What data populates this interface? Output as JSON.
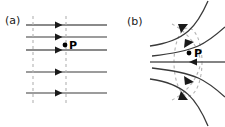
{
  "figure": {
    "width": 225,
    "height": 127,
    "background": "#ffffff",
    "line_color": "#3a3a3a",
    "bold_line_color": "#808080",
    "dash_color": "#b0b0b0",
    "point_color": "#000000",
    "text_color": "#1a1a1a"
  },
  "panels": [
    {
      "id": "a",
      "label": "(a)",
      "description": "uniform-parallel-field-lines",
      "point": {
        "label": "P",
        "x": 65,
        "y": 45
      },
      "field_lines": [
        {
          "y": 25,
          "weight": "bold",
          "x1": 26,
          "x2": 107,
          "arrow_x": 58,
          "arrow_dir": "right"
        },
        {
          "y": 37,
          "weight": "normal",
          "x1": 26,
          "x2": 107,
          "arrow_x": 58,
          "arrow_dir": "right"
        },
        {
          "y": 50,
          "weight": "bold",
          "x1": 26,
          "x2": 107,
          "arrow_x": 58,
          "arrow_dir": "right"
        },
        {
          "y": 72,
          "weight": "normal",
          "x1": 26,
          "x2": 107,
          "arrow_x": 58,
          "arrow_dir": "right"
        },
        {
          "y": 93,
          "weight": "normal",
          "x1": 26,
          "x2": 107,
          "arrow_x": 58,
          "arrow_dir": "right"
        }
      ],
      "dashed_verticals": [
        {
          "x": 33,
          "y1": 16,
          "y2": 106
        },
        {
          "x": 66,
          "y1": 16,
          "y2": 106
        }
      ]
    },
    {
      "id": "b",
      "label": "(b)",
      "description": "converging-curved-field-lines",
      "point": {
        "label": "P",
        "x": 189,
        "y": 53
      },
      "axis_line": {
        "y": 62,
        "x1": 150,
        "x2": 225,
        "arrow_x": 190,
        "arrow_dir": "left"
      },
      "curved_lines": [
        {
          "path": "M 207 2 C 196 26 186 40 150 46",
          "arrow_t": 0.46,
          "arrow_dir": "left"
        },
        {
          "path": "M 225 28 C 205 44 196 50 152 55",
          "arrow_t": 0.46,
          "arrow_dir": "left"
        },
        {
          "path": "M 207 124 C 196 100 186 85 150 79",
          "arrow_t": 0.46,
          "arrow_dir": "left"
        },
        {
          "path": "M 225 98 C 205 82 196 76 152 70",
          "arrow_t": 0.46,
          "arrow_dir": "left"
        }
      ],
      "dashed_curves": [
        {
          "description": "equipotential-oval",
          "cx": 188,
          "cy": 62,
          "rx": 14,
          "ry": 34
        },
        {
          "description": "outer-dashed-arc-upper",
          "path": "M 173 24 C 185 30 196 42 200 58"
        },
        {
          "description": "outer-dashed-arc-lower",
          "path": "M 173 100 C 185 94 196 82 200 66"
        }
      ]
    }
  ]
}
